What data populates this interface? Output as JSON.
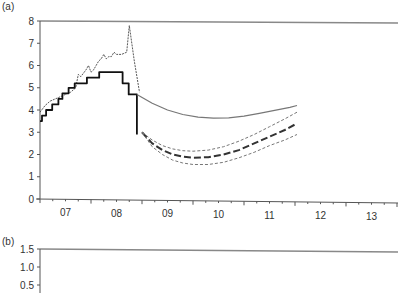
{
  "panels": [
    {
      "label": "(a)"
    },
    {
      "label": "(b)"
    }
  ],
  "chart_data": [
    {
      "panel": "(a)",
      "type": "line",
      "title": "",
      "xlabel": "",
      "ylabel": "",
      "ylim": [
        0,
        8
      ],
      "yticks": [
        0,
        1,
        2,
        3,
        4,
        5,
        6,
        7,
        8
      ],
      "xlim": [
        2007.0,
        2014.0
      ],
      "xtick_labels": [
        "07",
        "08",
        "09",
        "10",
        "11",
        "12",
        "13"
      ],
      "grid": false,
      "legend": null,
      "series": [
        {
          "name": "noisy-dashed-series",
          "style": "thin-dashed-dark",
          "x": [
            2007.0,
            2007.1,
            2007.2,
            2007.3,
            2007.4,
            2007.5,
            2007.6,
            2007.7,
            2007.75,
            2007.8,
            2007.9,
            2007.95,
            2008.0,
            2008.05,
            2008.1,
            2008.15,
            2008.2,
            2008.25,
            2008.3,
            2008.35,
            2008.4,
            2008.45,
            2008.5,
            2008.6,
            2008.7,
            2008.75,
            2008.8,
            2008.85,
            2008.9,
            2008.95
          ],
          "y": [
            3.9,
            4.2,
            4.4,
            4.5,
            4.6,
            4.7,
            4.8,
            5.0,
            5.6,
            5.5,
            5.8,
            6.0,
            5.7,
            5.8,
            6.0,
            6.2,
            6.3,
            6.5,
            6.3,
            6.4,
            6.4,
            6.6,
            6.5,
            6.5,
            6.6,
            7.8,
            7.0,
            6.2,
            5.5,
            4.8
          ]
        },
        {
          "name": "step-series",
          "style": "thick-solid-black",
          "x": [
            2007.0,
            2007.04,
            2007.04,
            2007.12,
            2007.12,
            2007.24,
            2007.24,
            2007.36,
            2007.36,
            2007.44,
            2007.44,
            2007.56,
            2007.56,
            2007.68,
            2007.68,
            2007.92,
            2007.92,
            2008.16,
            2008.16,
            2008.36,
            2008.36,
            2008.62,
            2008.62,
            2008.74,
            2008.74,
            2008.8,
            2008.8,
            2008.9,
            2008.9
          ],
          "y": [
            3.5,
            3.5,
            3.75,
            3.75,
            4.0,
            4.0,
            4.25,
            4.25,
            4.5,
            4.5,
            4.75,
            4.75,
            5.0,
            5.0,
            5.2,
            5.2,
            5.45,
            5.45,
            5.7,
            5.7,
            5.7,
            5.7,
            5.2,
            5.2,
            4.7,
            4.7,
            4.7,
            4.7,
            2.9
          ]
        },
        {
          "name": "solid-gray-forecast",
          "style": "solid-gray",
          "x": [
            2008.9,
            2009.2,
            2009.5,
            2009.8,
            2010.1,
            2010.4,
            2010.7,
            2011.0,
            2011.3,
            2011.6,
            2011.9,
            2012.04
          ],
          "y": [
            4.7,
            4.3,
            4.0,
            3.8,
            3.68,
            3.63,
            3.65,
            3.72,
            3.85,
            3.98,
            4.12,
            4.2
          ]
        },
        {
          "name": "central-forecast",
          "style": "thick-dashed-dark",
          "x": [
            2009.0,
            2009.2,
            2009.4,
            2009.6,
            2009.8,
            2010.0,
            2010.3,
            2010.6,
            2010.9,
            2011.2,
            2011.5,
            2011.8,
            2012.04
          ],
          "y": [
            3.0,
            2.5,
            2.2,
            2.0,
            1.9,
            1.85,
            1.88,
            2.0,
            2.2,
            2.5,
            2.8,
            3.1,
            3.4
          ]
        },
        {
          "name": "upper-band",
          "style": "thin-dashed-gray",
          "x": [
            2009.0,
            2009.2,
            2009.4,
            2009.6,
            2009.8,
            2010.0,
            2010.3,
            2010.6,
            2010.9,
            2011.2,
            2011.5,
            2011.8,
            2012.04
          ],
          "y": [
            3.0,
            2.65,
            2.4,
            2.25,
            2.17,
            2.15,
            2.2,
            2.35,
            2.6,
            2.9,
            3.25,
            3.6,
            3.9
          ]
        },
        {
          "name": "lower-band",
          "style": "thin-dashed-gray",
          "x": [
            2009.0,
            2009.2,
            2009.4,
            2009.6,
            2009.8,
            2010.0,
            2010.3,
            2010.6,
            2010.9,
            2011.2,
            2011.5,
            2011.8,
            2012.04
          ],
          "y": [
            3.0,
            2.35,
            2.0,
            1.75,
            1.62,
            1.55,
            1.55,
            1.65,
            1.85,
            2.1,
            2.4,
            2.65,
            2.9
          ]
        }
      ]
    },
    {
      "panel": "(b)",
      "type": "line",
      "title": "",
      "xlabel": "",
      "ylabel": "",
      "yticks_visible": [
        "1.5",
        "1.0",
        "0.5"
      ],
      "ylim": [
        0.5,
        1.5
      ],
      "series": [],
      "note": "Panel truncated at image bottom; only top frame and y tick labels visible"
    }
  ]
}
